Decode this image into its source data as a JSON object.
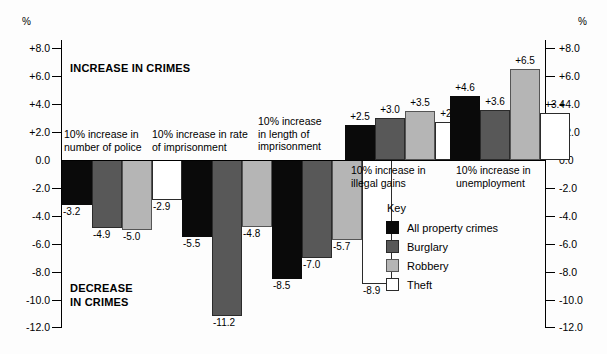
{
  "chart_data": {
    "type": "bar",
    "title": "",
    "subtitle": "",
    "xlabel": "",
    "ylabel": "%",
    "ylim": [
      -12.0,
      8.0
    ],
    "grid": false,
    "legend_position": "inside-lower-center",
    "y_unit_label_left": "%",
    "y_unit_label_right": "%",
    "y_ticks": [
      "+8.0",
      "+6.0",
      "+4.0",
      "+2.0",
      "0.0",
      "-2.0",
      "-4.0",
      "-6.0",
      "-8.0",
      "-10.0",
      "-12.0"
    ],
    "y_tick_values": [
      8.0,
      6.0,
      4.0,
      2.0,
      0.0,
      -2.0,
      -4.0,
      -6.0,
      -8.0,
      -10.0,
      -12.0
    ],
    "annotations": [
      {
        "text": "INCREASE IN CRIMES",
        "x_frac": 0.135,
        "y_value": 6.1
      },
      {
        "text": "DECREASE\nIN CRIMES",
        "x_frac": 0.135,
        "y_value": -8.6
      }
    ],
    "categories": [
      "10% increase in number of police",
      "10% increase in rate of imprisonment",
      "10% increase in length of imprisonment",
      "10% increase in illegal gains",
      "10% increase in unemployment"
    ],
    "category_captions": [
      "10% increase in\nnumber of police",
      "10% increase in rate\nof imprisonment",
      "10% increase\nin length of\nimprisonment",
      "10% increase in\nillegal gains",
      "10% increase in\nunemployment"
    ],
    "series": [
      {
        "name": "All property crimes",
        "color": "#0a0a0a",
        "values": [
          -3.2,
          -5.5,
          -8.5,
          2.5,
          4.6
        ],
        "labels": [
          "-3.2",
          "-5.5",
          "-8.5",
          "+2.5",
          "+4.6"
        ]
      },
      {
        "name": "Burglary",
        "color": "#585858",
        "values": [
          -4.9,
          -11.2,
          -7.0,
          3.0,
          3.6
        ],
        "labels": [
          "-4.9",
          "-11.2",
          "-7.0",
          "+3.0",
          "+3.6"
        ]
      },
      {
        "name": "Robbery",
        "color": "#b5b5b5",
        "values": [
          -5.0,
          -4.8,
          -5.7,
          3.5,
          6.5
        ],
        "labels": [
          "-5.0",
          "-4.8",
          "-5.7",
          "+3.5",
          "+6.5"
        ]
      },
      {
        "name": "Theft",
        "color": "#ffffff",
        "values": [
          -2.9,
          -3.4,
          -8.9,
          2.7,
          3.4
        ],
        "labels": [
          "-2.9",
          "-3.4",
          "-8.9",
          "+2.7",
          "+3.4"
        ]
      }
    ]
  },
  "legend": {
    "title": "Key",
    "items": [
      {
        "label": "All property crimes",
        "swatch": "black-swatch"
      },
      {
        "label": "Burglary",
        "swatch": "dark-gray-swatch"
      },
      {
        "label": "Robbery",
        "swatch": "light-gray-swatch"
      },
      {
        "label": "Theft",
        "swatch": "white-swatch"
      }
    ]
  }
}
